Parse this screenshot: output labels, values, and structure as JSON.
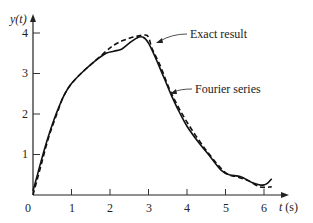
{
  "chart_data": {
    "type": "line",
    "title": "",
    "xlabel": "t (s)",
    "ylabel": "y(t)",
    "xlim": [
      0,
      6.5
    ],
    "ylim": [
      0,
      4.2
    ],
    "grid": false,
    "x_ticks": [
      "0",
      "1",
      "2",
      "3",
      "4",
      "5",
      "6"
    ],
    "y_ticks": [
      "1",
      "2",
      "3",
      "4"
    ],
    "annotations": [
      {
        "text": "Exact result",
        "points_to": "dashed curve near t≈3, y≈3.9"
      },
      {
        "text": "Fourier series",
        "points_to": "solid curve near t≈3.5, y≈3.0"
      }
    ],
    "series": [
      {
        "name": "Fourier series",
        "style": "solid",
        "x": [
          0.0,
          0.1,
          0.2,
          0.4,
          0.6,
          0.8,
          1.0,
          1.3,
          1.6,
          1.9,
          2.1,
          2.3,
          2.5,
          2.7,
          2.85,
          3.0,
          3.2,
          3.4,
          3.6,
          3.8,
          4.0,
          4.3,
          4.6,
          4.9,
          5.1,
          5.4,
          5.7,
          5.9,
          6.0,
          6.1,
          6.2
        ],
        "y": [
          0.1,
          0.45,
          0.8,
          1.45,
          2.0,
          2.45,
          2.75,
          3.05,
          3.3,
          3.5,
          3.55,
          3.6,
          3.75,
          3.88,
          3.9,
          3.75,
          3.35,
          2.9,
          2.45,
          2.05,
          1.7,
          1.3,
          0.95,
          0.6,
          0.5,
          0.45,
          0.3,
          0.25,
          0.25,
          0.3,
          0.4
        ]
      },
      {
        "name": "Exact result",
        "style": "dashed",
        "x": [
          0.0,
          0.1,
          0.2,
          0.4,
          0.6,
          0.8,
          1.0,
          1.3,
          1.6,
          1.9,
          2.1,
          2.3,
          2.5,
          2.7,
          2.9,
          3.0,
          3.1,
          3.3,
          3.6,
          4.0,
          4.5,
          5.0,
          5.3,
          5.6,
          5.9,
          6.2
        ],
        "y": [
          0.0,
          0.35,
          0.7,
          1.4,
          1.95,
          2.45,
          2.75,
          3.05,
          3.3,
          3.55,
          3.7,
          3.8,
          3.87,
          3.92,
          3.95,
          3.9,
          3.6,
          3.2,
          2.5,
          1.8,
          1.1,
          0.55,
          0.45,
          0.35,
          0.2,
          0.2
        ]
      }
    ]
  },
  "labels": {
    "ylabel": "y(t)",
    "xlabel": "t (s)",
    "exact": "Exact result",
    "fourier": "Fourier series",
    "origin": "0",
    "x_ticks": [
      "1",
      "2",
      "3",
      "4",
      "5",
      "6"
    ],
    "y_ticks": [
      "1",
      "2",
      "3",
      "4"
    ]
  }
}
